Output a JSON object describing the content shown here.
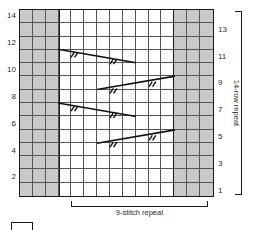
{
  "chart": {
    "kind": "knitting-stitch-chart",
    "columns": 15,
    "rows": 14,
    "colors": {
      "purl_cell": "#c9c9c9",
      "knit_cell": "#ffffff",
      "grid_line": "#555555",
      "border": "#1a1a1a",
      "symbol": "#111111",
      "text": "#2b2b2b"
    },
    "shaded_columns": [
      1,
      2,
      3,
      13,
      14,
      15
    ],
    "repeat_columns": [
      4,
      5,
      6,
      7,
      8,
      9,
      10,
      11,
      12
    ]
  },
  "row_numbers": {
    "left_labels": [
      "14",
      "12",
      "10",
      "8",
      "6",
      "4",
      "2"
    ],
    "left_rows": [
      14,
      12,
      10,
      8,
      6,
      4,
      2
    ],
    "right_labels": [
      "13",
      "11",
      "9",
      "7",
      "5",
      "3",
      "1"
    ],
    "right_rows": [
      13,
      11,
      9,
      7,
      5,
      3,
      1
    ]
  },
  "brackets": {
    "row_repeat_label": "14-row repeat",
    "stitch_repeat_label": "9-stitch repeat"
  },
  "symbols": [
    {
      "id": "twist-left-row11",
      "name": "left-leaning-travelling-stitch",
      "row": 11,
      "direction": "down-right",
      "start_col": 4,
      "end_col": 9,
      "ticks": 2
    },
    {
      "id": "twist-right-row9",
      "name": "right-leaning-travelling-stitch",
      "row": 9,
      "direction": "up-right",
      "start_col": 7,
      "end_col": 12,
      "ticks": 2
    },
    {
      "id": "twist-left-row7",
      "name": "left-leaning-travelling-stitch",
      "row": 7,
      "direction": "down-right",
      "start_col": 4,
      "end_col": 9,
      "ticks": 2
    },
    {
      "id": "twist-right-row5",
      "name": "right-leaning-travelling-stitch",
      "row": 5,
      "direction": "up-right",
      "start_col": 7,
      "end_col": 12,
      "ticks": 2
    }
  ],
  "legend": {
    "swatch_label": ""
  }
}
